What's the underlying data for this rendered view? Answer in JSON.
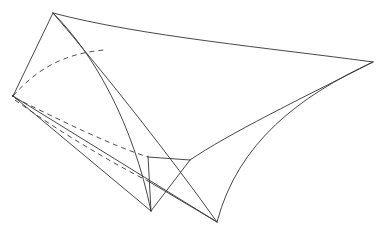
{
  "figure": {
    "background_color": "#ffffff",
    "stroke_color": "#333333",
    "hidden_stroke_color": "#3a3a3a",
    "stroke_width": 0.9,
    "hidden_dash_pattern": "5 4",
    "width": 386,
    "height": 234,
    "vertices": [
      {
        "name": "top-apex",
        "x": 53,
        "y": 13
      },
      {
        "name": "left-cusp",
        "x": 13,
        "y": 96
      },
      {
        "name": "right-cusp",
        "x": 373,
        "y": 62
      },
      {
        "name": "bottom-left-cusp",
        "x": 151,
        "y": 211
      },
      {
        "name": "bottom-right-cusp",
        "x": 217,
        "y": 222
      },
      {
        "name": "center-node",
        "x": 190,
        "y": 160
      },
      {
        "name": "mid-left-node",
        "x": 148,
        "y": 157
      },
      {
        "name": "lower-left-node",
        "x": 148,
        "y": 181
      }
    ],
    "edges": [
      {
        "name": "edge-apex-to-left-cusp",
        "style": "solid",
        "kind": "line",
        "d": "M 53 13 L 13 96"
      },
      {
        "name": "edge-top-ridge-curve",
        "style": "solid",
        "kind": "curve",
        "d": "M 53 13 C 140 36 270 48 373 62"
      },
      {
        "name": "edge-apex-to-bottom-left-curve",
        "style": "solid",
        "kind": "curve",
        "d": "M 53 13 C 95 55 133 124 151 211"
      },
      {
        "name": "edge-apex-to-bottom-right-line",
        "style": "solid",
        "kind": "curve",
        "d": "M 53 13 C 106 75 170 156 217 222"
      },
      {
        "name": "edge-left-cusp-to-bottom-left",
        "style": "solid",
        "kind": "line",
        "d": "M 13 96 L 151 211"
      },
      {
        "name": "edge-left-cusp-to-bottom-right",
        "style": "solid",
        "kind": "line",
        "d": "M 13 96 L 217 222"
      },
      {
        "name": "edge-right-cusp-to-bottom-right-curve",
        "style": "solid",
        "kind": "curve",
        "d": "M 373 62 C 300 96 238 142 217 222"
      },
      {
        "name": "edge-right-cusp-to-center-node",
        "style": "solid",
        "kind": "curve",
        "d": "M 373 62 C 300 99 228 134 190 160"
      },
      {
        "name": "edge-center-node-to-bottom-left",
        "style": "solid",
        "kind": "line",
        "d": "M 190 160 L 151 211"
      },
      {
        "name": "edge-center-node-to-mid-left",
        "style": "solid",
        "kind": "line",
        "d": "M 190 160 L 148 157"
      },
      {
        "name": "edge-vertical-rib",
        "style": "solid",
        "kind": "line",
        "d": "M 148 156 L 151 211"
      },
      {
        "name": "edge-lower-left-node-to-bottom-right",
        "style": "solid",
        "kind": "line",
        "d": "M 148 181 L 217 222"
      },
      {
        "name": "edge-hidden-upper-arc",
        "style": "dashed",
        "kind": "curve",
        "d": "M 13 96 C 42 63 72 53 104 50"
      },
      {
        "name": "edge-hidden-mid-fold",
        "style": "dashed",
        "kind": "curve",
        "d": "M 15 98 C 60 120 110 145 148 157"
      },
      {
        "name": "edge-hidden-lower-fold",
        "style": "dashed",
        "kind": "curve",
        "d": "M 15 100 C 58 131 112 163 148 181"
      }
    ]
  }
}
